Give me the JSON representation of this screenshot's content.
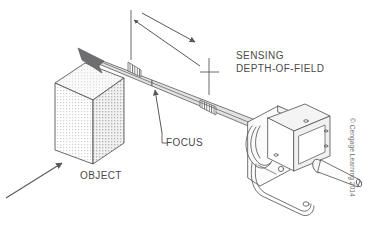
{
  "figure": {
    "type": "technical-diagram",
    "background_color": "#ffffff",
    "line_color": "#58585a",
    "fill_gray": "#d9d9d9"
  },
  "labels": {
    "sensing": "SENSING",
    "depth_of_field": "DEPTH-OF-FIELD",
    "focus": "FOCUS",
    "object": "OBJECT"
  },
  "credit": {
    "text": "© Cengage Learning 2014"
  },
  "annotations": {
    "dimension_name": "sensing-depth-of-field-dimension",
    "focus_callout_name": "focus-callout",
    "object_callout_name": "object-callout"
  }
}
